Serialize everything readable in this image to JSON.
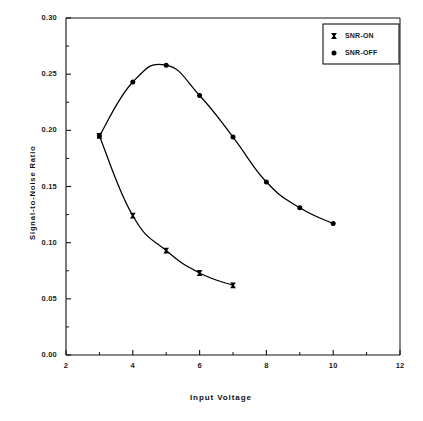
{
  "chart_data": {
    "type": "line",
    "title": "",
    "xlabel": "Input   Voltage",
    "ylabel": "Signal-to-Noise   Ratio",
    "xlim": [
      2,
      12
    ],
    "ylim": [
      0.0,
      0.3
    ],
    "xticks": [
      "2",
      "4",
      "6",
      "8",
      "10",
      "12"
    ],
    "xtick_values": [
      2,
      4,
      6,
      8,
      10,
      12
    ],
    "xminor_values": [
      3,
      5,
      7,
      9,
      11
    ],
    "yticks": [
      "0.00",
      "0.05",
      "0.10",
      "0.15",
      "0.20",
      "0.25",
      "0.30"
    ],
    "ytick_values": [
      0.0,
      0.05,
      0.1,
      0.15,
      0.2,
      0.25,
      0.3
    ],
    "yminor_values": [
      0.025,
      0.075,
      0.125,
      0.175,
      0.225,
      0.275
    ],
    "grid": false,
    "legend_position": "top-right",
    "series": [
      {
        "name": "SNR-ON",
        "marker": "x-square",
        "color": "#000000",
        "x": [
          3,
          4,
          5,
          6,
          7
        ],
        "values": [
          0.195,
          0.124,
          0.093,
          0.073,
          0.062
        ]
      },
      {
        "name": "SNR-OFF",
        "marker": "filled-circle",
        "color": "#000000",
        "x": [
          3,
          4,
          5,
          6,
          7,
          8,
          9,
          10
        ],
        "values": [
          0.195,
          0.243,
          0.258,
          0.231,
          0.194,
          0.154,
          0.131,
          0.117
        ]
      }
    ]
  },
  "legend": {
    "entries": [
      {
        "label": "SNR-ON"
      },
      {
        "label": "SNR-OFF"
      }
    ]
  },
  "axes": {
    "x_title": "Input   Voltage",
    "y_title": "Signal-to-Noise   Ratio"
  }
}
